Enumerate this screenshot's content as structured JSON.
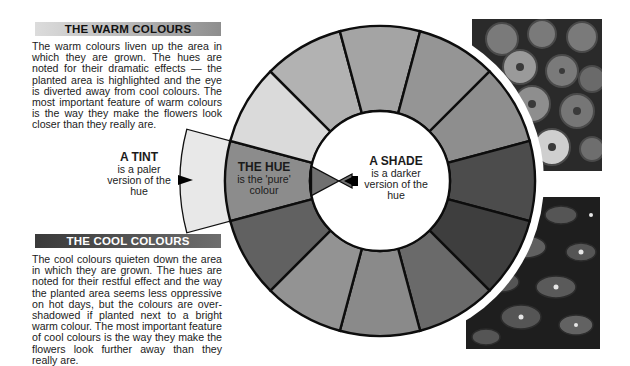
{
  "warm": {
    "heading": "THE WARM COLOURS",
    "body": "The warm colours liven up the area in which they are grown. The hues are noted for their dramatic effects — the planted area is highlighted and the eye is diverted away from cool colours. The most important feature of warm colours is the way they make the flowers look closer than they really are."
  },
  "cool": {
    "heading": "THE COOL COLOURS",
    "body": "The cool colours quieten down the area in which they are grown. The hues are noted for their restful effect and the way the planted area seems less oppressive on hot days, but the colours are over-shadowed if planted next to a bright warm colour. The most important feature of cool colours is the way they make the flowers look further away than they really are."
  },
  "wheel": {
    "center": [
      380,
      181
    ],
    "outer_radius": 155,
    "inner_radius": 70,
    "segment_colors": [
      "#8c8c8c",
      "#dadada",
      "#b2b2b2",
      "#a4a4a4",
      "#959595",
      "#8e8e8e",
      "#4c4c4c",
      "#3e3e3e",
      "#6a6a6a",
      "#8a8a8a",
      "#939393",
      "#616161"
    ],
    "tint_color": "#e8e8e8",
    "shade_color": "#707070"
  },
  "labels": {
    "tint": {
      "title": "A TINT",
      "text": "is a paler version of the hue"
    },
    "hue": {
      "title": "THE HUE",
      "text": "is the 'pure' colour"
    },
    "shade": {
      "title": "A SHADE",
      "text": "is a darker version of the hue"
    }
  },
  "photos": {
    "top": {
      "subject": "ranunculus-flowers-photo"
    },
    "bottom": {
      "subject": "blue-flowers-photo"
    }
  }
}
